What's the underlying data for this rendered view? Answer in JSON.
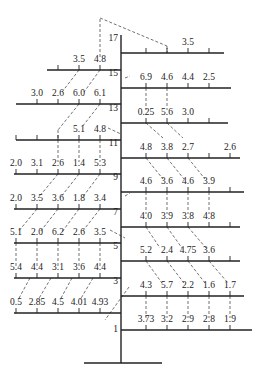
{
  "diagram": {
    "type": "branching-tree-with-values",
    "trunk": {
      "x": 121,
      "y_top": 35,
      "y_bottom": 363
    },
    "base": {
      "x1": 84,
      "x2": 162,
      "y": 363
    },
    "right_branches": [
      {
        "label": "17",
        "y": 53,
        "x_end": 224,
        "ticks": [
          146,
          167,
          188,
          209
        ],
        "values": [
          {
            "x": 188,
            "text": "3.5"
          }
        ]
      },
      {
        "label": "15",
        "y": 88,
        "x_end": 231,
        "ticks": [
          146,
          167,
          188,
          209
        ],
        "values": [
          {
            "x": 146,
            "text": "6.9"
          },
          {
            "x": 167,
            "text": "4.6"
          },
          {
            "x": 188,
            "text": "4.4"
          },
          {
            "x": 209,
            "text": "2.5"
          }
        ]
      },
      {
        "label": "13",
        "y": 123,
        "x_end": 228,
        "ticks": [
          146,
          167,
          188,
          209
        ],
        "values": [
          {
            "x": 146,
            "text": "0.25"
          },
          {
            "x": 167,
            "text": "5.6"
          },
          {
            "x": 188,
            "text": "3.0"
          }
        ]
      },
      {
        "label": "11",
        "y": 158,
        "x_end": 240,
        "ticks": [
          146,
          167,
          188,
          209,
          230
        ],
        "values": [
          {
            "x": 146,
            "text": "4.8"
          },
          {
            "x": 167,
            "text": "3.8"
          },
          {
            "x": 188,
            "text": "2.7"
          },
          {
            "x": 230,
            "text": "2.6"
          }
        ]
      },
      {
        "label": "9",
        "y": 192,
        "x_end": 244,
        "ticks": [
          146,
          167,
          188,
          209,
          230
        ],
        "values": [
          {
            "x": 146,
            "text": "4.6"
          },
          {
            "x": 167,
            "text": "3.6"
          },
          {
            "x": 188,
            "text": "4.6"
          },
          {
            "x": 209,
            "text": "3.9"
          }
        ]
      },
      {
        "label": "7",
        "y": 227,
        "x_end": 240,
        "ticks": [
          146,
          167,
          188,
          209,
          230
        ],
        "values": [
          {
            "x": 146,
            "text": "4.0"
          },
          {
            "x": 167,
            "text": "3.9"
          },
          {
            "x": 188,
            "text": "3.8"
          },
          {
            "x": 209,
            "text": "4.8"
          }
        ]
      },
      {
        "label": "5",
        "y": 261,
        "x_end": 240,
        "ticks": [
          146,
          167,
          188,
          209,
          230
        ],
        "values": [
          {
            "x": 146,
            "text": "5.2"
          },
          {
            "x": 167,
            "text": "2.4"
          },
          {
            "x": 188,
            "text": "4.75"
          },
          {
            "x": 209,
            "text": "3.6"
          }
        ]
      },
      {
        "label": "3",
        "y": 296,
        "x_end": 244,
        "ticks": [
          146,
          167,
          188,
          209,
          230
        ],
        "values": [
          {
            "x": 146,
            "text": "4.3"
          },
          {
            "x": 167,
            "text": "5.7"
          },
          {
            "x": 188,
            "text": "2.2"
          },
          {
            "x": 209,
            "text": "1.6"
          },
          {
            "x": 230,
            "text": "1.7"
          }
        ]
      },
      {
        "label": "1",
        "y": 330,
        "x_end": 252,
        "ticks": [
          146,
          167,
          188,
          209,
          230
        ],
        "values": [
          {
            "x": 146,
            "text": "3.73"
          },
          {
            "x": 167,
            "text": "3.2"
          },
          {
            "x": 188,
            "text": "2.9"
          },
          {
            "x": 209,
            "text": "2.8"
          },
          {
            "x": 230,
            "text": "1.9"
          }
        ]
      }
    ],
    "left_branches": [
      {
        "y": 70,
        "x_start": 47,
        "ticks": [
          58,
          79,
          100
        ],
        "values": [
          {
            "x": 79,
            "text": "3.5"
          },
          {
            "x": 100,
            "text": "4.8"
          }
        ]
      },
      {
        "y": 104,
        "x_start": 16,
        "ticks": [
          37,
          58,
          79,
          100
        ],
        "values": [
          {
            "x": 37,
            "text": "3.0"
          },
          {
            "x": 58,
            "text": "2.6"
          },
          {
            "x": 79,
            "text": "6.0"
          },
          {
            "x": 100,
            "text": "6.1"
          }
        ]
      },
      {
        "y": 140,
        "x_start": 16,
        "ticks": [
          16,
          37,
          58,
          79,
          100
        ],
        "values": [
          {
            "x": 79,
            "text": "5.1"
          },
          {
            "x": 100,
            "text": "4.8"
          }
        ]
      },
      {
        "y": 174,
        "x_start": 14,
        "ticks": [
          16,
          37,
          58,
          79,
          100
        ],
        "values": [
          {
            "x": 16,
            "text": "2.0"
          },
          {
            "x": 37,
            "text": "3.1"
          },
          {
            "x": 58,
            "text": "2.6"
          },
          {
            "x": 79,
            "text": "1.4"
          },
          {
            "x": 100,
            "text": "5.3"
          }
        ]
      },
      {
        "y": 209,
        "x_start": 14,
        "ticks": [
          16,
          37,
          58,
          79,
          100
        ],
        "values": [
          {
            "x": 16,
            "text": "2.0"
          },
          {
            "x": 37,
            "text": "3.5"
          },
          {
            "x": 58,
            "text": "3.6"
          },
          {
            "x": 79,
            "text": "1.8"
          },
          {
            "x": 100,
            "text": "3.4"
          }
        ]
      },
      {
        "y": 243,
        "x_start": 14,
        "ticks": [
          16,
          37,
          58,
          79,
          100
        ],
        "values": [
          {
            "x": 16,
            "text": "5.1"
          },
          {
            "x": 37,
            "text": "2.0"
          },
          {
            "x": 58,
            "text": "6.2"
          },
          {
            "x": 79,
            "text": "2.6"
          },
          {
            "x": 100,
            "text": "3.5"
          }
        ]
      },
      {
        "y": 278,
        "x_start": 14,
        "ticks": [
          16,
          37,
          58,
          79,
          100
        ],
        "values": [
          {
            "x": 16,
            "text": "5.4"
          },
          {
            "x": 37,
            "text": "4.4"
          },
          {
            "x": 58,
            "text": "3.1"
          },
          {
            "x": 79,
            "text": "3.6"
          },
          {
            "x": 100,
            "text": "4.4"
          }
        ]
      },
      {
        "y": 313,
        "x_start": 14,
        "ticks": [
          16,
          37,
          58,
          79,
          100
        ],
        "values": [
          {
            "x": 16,
            "text": "0.5"
          },
          {
            "x": 37,
            "text": "2.85"
          },
          {
            "x": 58,
            "text": "4.5"
          },
          {
            "x": 79,
            "text": "4.01"
          },
          {
            "x": 100,
            "text": "4.93"
          }
        ]
      }
    ],
    "dashed_links": [
      [
        100,
        57,
        100,
        18
      ],
      [
        100,
        18,
        167,
        46
      ],
      [
        167,
        46,
        167,
        53
      ],
      [
        146,
        88,
        146,
        110
      ],
      [
        167,
        88,
        167,
        110
      ],
      [
        146,
        123,
        163,
        138
      ],
      [
        167,
        123,
        183,
        138
      ],
      [
        146,
        158,
        163,
        179
      ],
      [
        167,
        158,
        184,
        179
      ],
      [
        188,
        158,
        205,
        179
      ],
      [
        146,
        192,
        146,
        214
      ],
      [
        167,
        192,
        167,
        214
      ],
      [
        188,
        192,
        188,
        214
      ],
      [
        209,
        192,
        209,
        214
      ],
      [
        146,
        227,
        160,
        248
      ],
      [
        167,
        227,
        182,
        248
      ],
      [
        188,
        227,
        206,
        248
      ],
      [
        146,
        261,
        162,
        283
      ],
      [
        167,
        261,
        184,
        283
      ],
      [
        188,
        261,
        205,
        283
      ],
      [
        209,
        261,
        228,
        283
      ],
      [
        146,
        296,
        146,
        318
      ],
      [
        167,
        296,
        167,
        318
      ],
      [
        188,
        296,
        188,
        318
      ],
      [
        209,
        296,
        209,
        318
      ],
      [
        230,
        296,
        230,
        318
      ],
      [
        79,
        70,
        62,
        92
      ],
      [
        100,
        70,
        84,
        92
      ],
      [
        79,
        104,
        58,
        130
      ],
      [
        58,
        130,
        58,
        140
      ],
      [
        100,
        104,
        82,
        127
      ],
      [
        58,
        140,
        58,
        162
      ],
      [
        79,
        140,
        79,
        162
      ],
      [
        100,
        140,
        100,
        162
      ],
      [
        58,
        174,
        38,
        198
      ],
      [
        79,
        174,
        60,
        198
      ],
      [
        100,
        174,
        82,
        198
      ],
      [
        37,
        209,
        18,
        232
      ],
      [
        58,
        209,
        40,
        232
      ],
      [
        79,
        209,
        62,
        232
      ],
      [
        100,
        209,
        82,
        232
      ],
      [
        16,
        243,
        16,
        266
      ],
      [
        37,
        243,
        37,
        266
      ],
      [
        58,
        243,
        58,
        266
      ],
      [
        79,
        243,
        79,
        266
      ],
      [
        100,
        243,
        100,
        266
      ],
      [
        30,
        278,
        18,
        300
      ],
      [
        51,
        278,
        38,
        300
      ],
      [
        72,
        278,
        60,
        300
      ],
      [
        93,
        278,
        80,
        300
      ],
      [
        129,
        287,
        105,
        320
      ],
      [
        110,
        230,
        125,
        238
      ],
      [
        125,
        78,
        130,
        76
      ],
      [
        125,
        196,
        130,
        193
      ],
      [
        108,
        128,
        121,
        134
      ]
    ]
  }
}
